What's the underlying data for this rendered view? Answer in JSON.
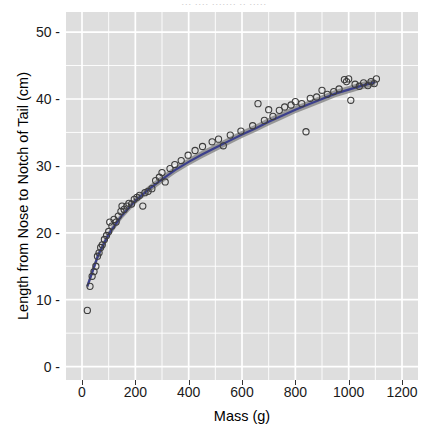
{
  "top_strip": {
    "text": "···  ····  ·······  ··  ·····"
  },
  "chart_data": {
    "type": "scatter",
    "title": "",
    "xlabel": "Mass (g)",
    "ylabel": "Length from Nose to Notch of Tail (cm)",
    "xlim": [
      -60,
      1260
    ],
    "ylim": [
      -2,
      53
    ],
    "xticks": [
      0,
      200,
      400,
      600,
      800,
      1000,
      1200
    ],
    "xtick_labels": [
      "0",
      "200",
      "400",
      "600",
      "800",
      "1000",
      "1200"
    ],
    "yticks": [
      0,
      10,
      20,
      30,
      40,
      50
    ],
    "ytick_labels": [
      "0 -",
      "10 -",
      "20 -",
      "30 -",
      "40 -",
      "50 -"
    ],
    "grid": true,
    "grid_color": "#ffffff",
    "panel_color": "#dedede",
    "legend": "none",
    "point_color": "#3d3d3d",
    "fit_line_color": "#3b3f8c",
    "fit_band_color": "#8a8a8a",
    "series": [
      {
        "name": "observations",
        "points": [
          [
            20,
            8.4
          ],
          [
            30,
            12.0
          ],
          [
            38,
            13.5
          ],
          [
            45,
            14.2
          ],
          [
            52,
            15.0
          ],
          [
            58,
            16.5
          ],
          [
            64,
            17.0
          ],
          [
            70,
            17.8
          ],
          [
            76,
            18.2
          ],
          [
            84,
            19.0
          ],
          [
            92,
            19.6
          ],
          [
            100,
            20.2
          ],
          [
            104,
            21.6
          ],
          [
            112,
            21.0
          ],
          [
            120,
            22.0
          ],
          [
            128,
            21.6
          ],
          [
            136,
            22.5
          ],
          [
            146,
            23.2
          ],
          [
            150,
            24.0
          ],
          [
            158,
            23.5
          ],
          [
            168,
            24.0
          ],
          [
            176,
            24.4
          ],
          [
            186,
            24.3
          ],
          [
            196,
            25.0
          ],
          [
            206,
            25.3
          ],
          [
            216,
            25.6
          ],
          [
            228,
            24.0
          ],
          [
            236,
            26.0
          ],
          [
            248,
            26.2
          ],
          [
            262,
            26.6
          ],
          [
            276,
            27.8
          ],
          [
            290,
            28.3
          ],
          [
            300,
            29.0
          ],
          [
            312,
            27.6
          ],
          [
            330,
            29.6
          ],
          [
            348,
            30.2
          ],
          [
            372,
            30.8
          ],
          [
            398,
            31.6
          ],
          [
            424,
            32.3
          ],
          [
            452,
            32.9
          ],
          [
            488,
            33.6
          ],
          [
            512,
            34.0
          ],
          [
            530,
            33.0
          ],
          [
            556,
            34.6
          ],
          [
            596,
            35.2
          ],
          [
            640,
            36.0
          ],
          [
            660,
            39.3
          ],
          [
            684,
            36.8
          ],
          [
            700,
            38.4
          ],
          [
            716,
            37.4
          ],
          [
            740,
            38.3
          ],
          [
            760,
            38.8
          ],
          [
            784,
            39.1
          ],
          [
            800,
            39.6
          ],
          [
            824,
            39.3
          ],
          [
            840,
            35.1
          ],
          [
            856,
            40.1
          ],
          [
            880,
            40.3
          ],
          [
            900,
            41.3
          ],
          [
            920,
            40.7
          ],
          [
            944,
            41.1
          ],
          [
            964,
            41.5
          ],
          [
            984,
            42.9
          ],
          [
            992,
            42.6
          ],
          [
            1000,
            43.0
          ],
          [
            1008,
            39.8
          ],
          [
            1024,
            42.2
          ],
          [
            1040,
            41.9
          ],
          [
            1056,
            42.4
          ],
          [
            1072,
            42.0
          ],
          [
            1084,
            42.6
          ],
          [
            1096,
            42.3
          ],
          [
            1104,
            43.0
          ]
        ]
      }
    ],
    "fit_curve": [
      [
        20,
        12.0
      ],
      [
        60,
        16.6
      ],
      [
        100,
        19.8
      ],
      [
        150,
        22.6
      ],
      [
        200,
        24.8
      ],
      [
        250,
        26.5
      ],
      [
        300,
        28.0
      ],
      [
        350,
        29.4
      ],
      [
        400,
        30.6
      ],
      [
        450,
        31.7
      ],
      [
        500,
        32.7
      ],
      [
        550,
        33.7
      ],
      [
        600,
        34.7
      ],
      [
        650,
        35.6
      ],
      [
        700,
        36.6
      ],
      [
        750,
        37.5
      ],
      [
        800,
        38.4
      ],
      [
        850,
        39.2
      ],
      [
        900,
        40.0
      ],
      [
        950,
        40.8
      ],
      [
        1000,
        41.4
      ],
      [
        1050,
        42.0
      ],
      [
        1100,
        42.5
      ]
    ],
    "fit_band_halfwidth": 0.55
  }
}
